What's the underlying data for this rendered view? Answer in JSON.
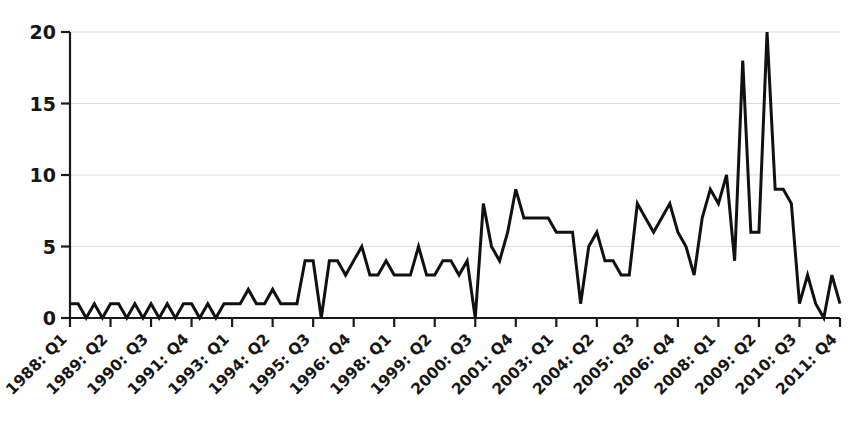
{
  "chart_data": {
    "type": "line",
    "title": "",
    "subtitle": "",
    "xlabel": "",
    "ylabel": "",
    "xlim": [
      0,
      95
    ],
    "ylim": [
      0,
      20
    ],
    "yticks": [
      0,
      5,
      10,
      15,
      20
    ],
    "ytick_labels": [
      "0",
      "5",
      "10",
      "15",
      "20"
    ],
    "grid": true,
    "grid_axis": "y",
    "legend": false,
    "legend_position": "none",
    "line_color": "#111111",
    "line_width": 3,
    "background_color": "#ffffff",
    "axis_color": "#1a1a1a",
    "grid_color": "#dcdcdc",
    "xtick_labels": [
      "1988: Q1",
      "1989: Q2",
      "1990: Q3",
      "1991: Q4",
      "1993: Q1",
      "1994: Q2",
      "1995: Q3",
      "1996: Q4",
      "1998: Q1",
      "1999: Q2",
      "2000: Q3",
      "2001: Q4",
      "2003: Q1",
      "2004: Q2",
      "2005: Q3",
      "2006: Q4",
      "2008: Q1",
      "2009: Q2",
      "2010: Q3",
      "2011: Q4"
    ],
    "xtick_label_rotation": -45,
    "xtick_every_n_points": 5,
    "x": [
      0,
      1,
      2,
      3,
      4,
      5,
      6,
      7,
      8,
      9,
      10,
      11,
      12,
      13,
      14,
      15,
      16,
      17,
      18,
      19,
      20,
      21,
      22,
      23,
      24,
      25,
      26,
      27,
      28,
      29,
      30,
      31,
      32,
      33,
      34,
      35,
      36,
      37,
      38,
      39,
      40,
      41,
      42,
      43,
      44,
      45,
      46,
      47,
      48,
      49,
      50,
      51,
      52,
      53,
      54,
      55,
      56,
      57,
      58,
      59,
      60,
      61,
      62,
      63,
      64,
      65,
      66,
      67,
      68,
      69,
      70,
      71,
      72,
      73,
      74,
      75,
      76,
      77,
      78,
      79,
      80,
      81,
      82,
      83,
      84,
      85,
      86,
      87,
      88,
      89,
      90,
      91,
      92,
      93,
      94,
      95
    ],
    "values": [
      1,
      1,
      0,
      1,
      0,
      1,
      1,
      0,
      1,
      0,
      1,
      0,
      1,
      0,
      1,
      1,
      0,
      1,
      0,
      1,
      1,
      1,
      2,
      1,
      1,
      2,
      1,
      1,
      1,
      4,
      4,
      0,
      4,
      4,
      3,
      4,
      5,
      3,
      3,
      4,
      3,
      3,
      3,
      5,
      3,
      3,
      4,
      4,
      3,
      4,
      0,
      8,
      5,
      4,
      6,
      9,
      7,
      7,
      7,
      7,
      6,
      6,
      6,
      1,
      5,
      6,
      4,
      4,
      3,
      3,
      8,
      7,
      6,
      7,
      8,
      6,
      5,
      3,
      7,
      9,
      8,
      10,
      4,
      18,
      6,
      6,
      20,
      9,
      9,
      8,
      1,
      3,
      1,
      0,
      3,
      1
    ],
    "series": [
      {
        "name": "series-1",
        "values": [
          1,
          1,
          0,
          1,
          0,
          1,
          1,
          0,
          1,
          0,
          1,
          0,
          1,
          0,
          1,
          1,
          0,
          1,
          0,
          1,
          1,
          1,
          2,
          1,
          1,
          2,
          1,
          1,
          1,
          4,
          4,
          0,
          4,
          4,
          3,
          4,
          5,
          3,
          3,
          4,
          3,
          3,
          3,
          5,
          3,
          3,
          4,
          4,
          3,
          4,
          0,
          8,
          5,
          4,
          6,
          9,
          7,
          7,
          7,
          7,
          6,
          6,
          6,
          1,
          5,
          6,
          4,
          4,
          3,
          3,
          8,
          7,
          6,
          7,
          8,
          6,
          5,
          3,
          7,
          9,
          8,
          10,
          4,
          18,
          6,
          6,
          20,
          9,
          9,
          8,
          1,
          3,
          1,
          0,
          3,
          1
        ]
      }
    ]
  },
  "plot_geometry": {
    "left": 70,
    "right": 840,
    "top": 32,
    "bottom": 318
  }
}
